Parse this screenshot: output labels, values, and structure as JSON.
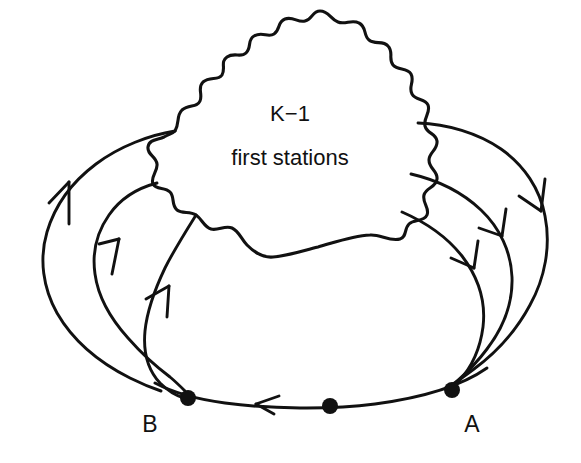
{
  "figure": {
    "background_color": "#ffffff",
    "stroke_color": "#111111",
    "width": 581,
    "height": 463
  },
  "blob": {
    "name": "cloud-region",
    "label_line_1": "K−1",
    "label_line_2": "first stations",
    "label_1_position": {
      "x": 290,
      "y": 121
    },
    "label_2_position": {
      "x": 290,
      "y": 165
    }
  },
  "nodes": [
    {
      "id": "B",
      "label": "B",
      "dot_position": {
        "x": 188,
        "y": 398
      },
      "label_position": {
        "x": 150,
        "y": 432
      },
      "dot_radius": 8
    },
    {
      "id": "mid",
      "label": "",
      "dot_position": {
        "x": 330,
        "y": 406
      },
      "label_position": {
        "x": 330,
        "y": 432
      },
      "dot_radius": 8
    },
    {
      "id": "A",
      "label": "A",
      "dot_position": {
        "x": 452,
        "y": 390
      },
      "label_position": {
        "x": 472,
        "y": 432
      },
      "dot_radius": 8
    }
  ],
  "arcs": [
    {
      "name": "left-outer-arc",
      "direction": "B-to-blob",
      "arrow_direction": "up",
      "arrow_position": {
        "x": 62,
        "y": 185
      }
    },
    {
      "name": "left-middle-arc",
      "direction": "B-to-blob",
      "arrow_direction": "up",
      "arrow_position": {
        "x": 115,
        "y": 240
      }
    },
    {
      "name": "left-inner-arc",
      "direction": "B-to-blob",
      "arrow_direction": "up",
      "arrow_position": {
        "x": 162,
        "y": 280
      }
    },
    {
      "name": "right-outer-arc",
      "direction": "blob-to-A",
      "arrow_direction": "down",
      "arrow_position": {
        "x": 532,
        "y": 200
      }
    },
    {
      "name": "right-middle-arc",
      "direction": "blob-to-A",
      "arrow_direction": "down",
      "arrow_position": {
        "x": 498,
        "y": 228
      }
    },
    {
      "name": "right-inner-arc",
      "direction": "blob-to-A",
      "arrow_direction": "down",
      "arrow_position": {
        "x": 468,
        "y": 260
      }
    },
    {
      "name": "bottom-feedback-arc",
      "direction": "A-to-B",
      "arrow_direction": "left",
      "arrow_position": {
        "x": 258,
        "y": 404
      }
    }
  ]
}
